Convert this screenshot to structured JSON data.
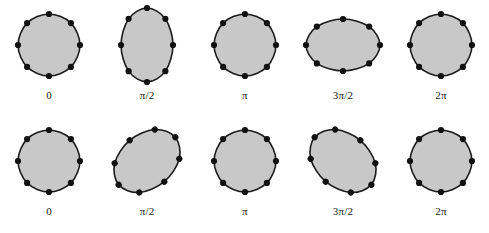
{
  "figure": {
    "background_color": "#ffffff",
    "fill_color": "#c8c8c8",
    "outline_color": "#1a1a1a",
    "marker_color": "#111111",
    "marker_count": 8,
    "rows": [
      {
        "name": "breathing-stretch-mode",
        "cells": [
          {
            "label": "0",
            "shape": "circle",
            "rx": 31,
            "ry": 31,
            "rotation": 0
          },
          {
            "label": "π/2",
            "shape": "ellipse-vertical",
            "rx": 26,
            "ry": 37,
            "rotation": 0
          },
          {
            "label": "π",
            "shape": "circle",
            "rx": 31,
            "ry": 31,
            "rotation": 0
          },
          {
            "label": "3π/2",
            "shape": "ellipse-horizontal",
            "rx": 37,
            "ry": 26,
            "rotation": 0
          },
          {
            "label": "2π",
            "shape": "circle",
            "rx": 31,
            "ry": 31,
            "rotation": 0
          }
        ]
      },
      {
        "name": "shear-rotated-mode",
        "cells": [
          {
            "label": "0",
            "shape": "circle",
            "rx": 31,
            "ry": 31,
            "rotation": 0
          },
          {
            "label": "π/2",
            "shape": "ellipse-tilted-ccw",
            "rx": 37,
            "ry": 27,
            "rotation": -40
          },
          {
            "label": "π",
            "shape": "circle",
            "rx": 31,
            "ry": 31,
            "rotation": 0
          },
          {
            "label": "3π/2",
            "shape": "ellipse-tilted-cw",
            "rx": 37,
            "ry": 27,
            "rotation": 40
          },
          {
            "label": "2π",
            "shape": "circle",
            "rx": 31,
            "ry": 31,
            "rotation": 0
          }
        ]
      }
    ]
  }
}
